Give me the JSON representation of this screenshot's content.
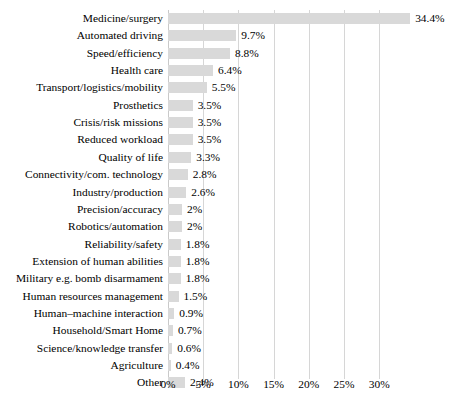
{
  "chart_data": {
    "type": "bar",
    "orientation": "horizontal",
    "title": "",
    "subtitle": "",
    "xlabel": "",
    "ylabel": "",
    "xlim": [
      0,
      35
    ],
    "grid": true,
    "legend": null,
    "xticks": [
      "0%",
      "5%",
      "10%",
      "15%",
      "20%",
      "25%",
      "30%"
    ],
    "xtick_values": [
      0,
      5,
      10,
      15,
      20,
      25,
      30
    ],
    "bar_color": "#d9d9d9",
    "gridline_color": "#d6d6d6",
    "text_color": "#000000",
    "categories": [
      "Medicine/surgery",
      "Automated driving",
      "Speed/efficiency",
      "Health care",
      "Transport/logistics/mobility",
      "Prosthetics",
      "Crisis/risk missions",
      "Reduced workload",
      "Quality of life",
      "Connectivity/com. technology",
      "Industry/production",
      "Precision/accuracy",
      "Robotics/automation",
      "Reliability/safety",
      "Extension of human abilities",
      "Military e.g. bomb disarmament",
      "Human resources management",
      "Human–machine interaction",
      "Household/Smart Home",
      "Science/knowledge transfer",
      "Agriculture",
      "Other"
    ],
    "values": [
      34.4,
      9.7,
      8.8,
      6.4,
      5.5,
      3.5,
      3.5,
      3.5,
      3.3,
      2.8,
      2.6,
      2,
      2,
      1.8,
      1.8,
      1.8,
      1.5,
      0.9,
      0.7,
      0.6,
      0.4,
      2.4
    ],
    "data_labels": [
      "34.4%",
      "9.7%",
      "8.8%",
      "6.4%",
      "5.5%",
      "3.5%",
      "3.5%",
      "3.5%",
      "3.3%",
      "2.8%",
      "2.6%",
      "2%",
      "2%",
      "1.8%",
      "1.8%",
      "1.8%",
      "1.5%",
      "0.9%",
      "0.7%",
      "0.6%",
      "0.4%",
      "2.4%"
    ]
  }
}
